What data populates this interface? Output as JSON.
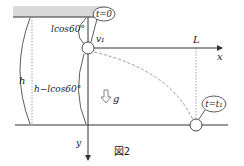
{
  "figure": {
    "caption": "図2",
    "labels": {
      "h": "h",
      "lcos60": "lcos60°",
      "h_minus_lcos60": "h−lcos60°",
      "t0": "t=0",
      "t1": "t=t₁",
      "v1": "v₁",
      "L": "L",
      "x": "x",
      "y": "y",
      "g": "g"
    },
    "colors": {
      "ceiling_fill": "#d9d9d9",
      "line": "#333333",
      "dashed_path": "#999999",
      "dotted_guide": "#888888"
    }
  }
}
